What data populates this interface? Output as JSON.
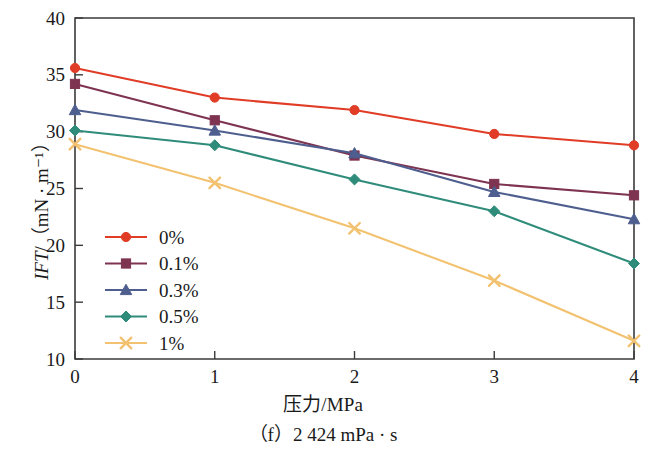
{
  "figure": {
    "caption": "（f）2 424 mPa · s",
    "y_axis_title_prefix": "IFT",
    "y_axis_title_rest": "/（mN · m⁻¹）",
    "x_axis_title": "压力/MPa"
  },
  "chart_data": {
    "type": "line",
    "title": "",
    "subtitle": "",
    "xlabel": "压力/MPa",
    "ylabel": "IFT/(mN · m⁻¹)",
    "x": [
      0,
      1,
      2,
      3,
      4
    ],
    "xticklabels": [
      "0",
      "1",
      "2",
      "3",
      "4"
    ],
    "yticks": [
      10,
      15,
      20,
      25,
      30,
      35,
      40
    ],
    "yticklabels": [
      "10",
      "15",
      "20",
      "25",
      "30",
      "35",
      "40"
    ],
    "xlim": [
      0,
      4
    ],
    "ylim": [
      10,
      40
    ],
    "grid": false,
    "legend_position": "lower-left-inside",
    "series": [
      {
        "name": "0%",
        "color": "#e03c26",
        "marker": "circle",
        "values": [
          35.6,
          33.0,
          31.9,
          29.8,
          28.8
        ]
      },
      {
        "name": "0.1%",
        "color": "#7e3350",
        "marker": "square",
        "values": [
          34.2,
          31.0,
          27.9,
          25.4,
          24.4
        ]
      },
      {
        "name": "0.3%",
        "color": "#4d5e8f",
        "marker": "triangle",
        "values": [
          31.9,
          30.1,
          28.1,
          24.7,
          22.3
        ]
      },
      {
        "name": "0.5%",
        "color": "#2f8c7a",
        "marker": "diamond",
        "values": [
          30.1,
          28.8,
          25.8,
          23.0,
          18.4
        ]
      },
      {
        "name": "1%",
        "color": "#f3c270",
        "marker": "x",
        "values": [
          28.9,
          25.5,
          21.5,
          16.9,
          11.6
        ]
      }
    ]
  }
}
